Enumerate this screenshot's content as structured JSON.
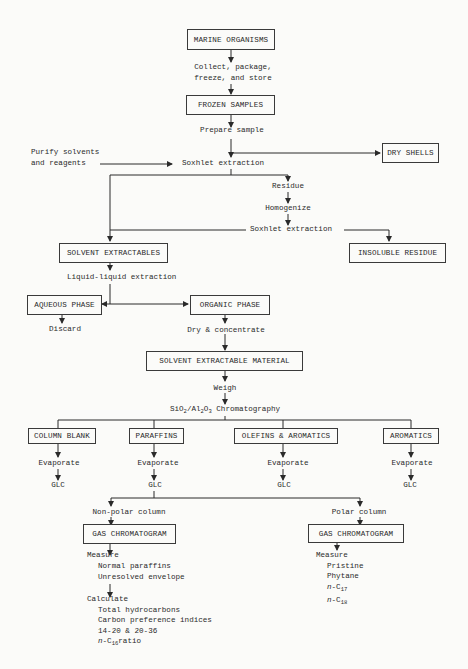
{
  "boxes": {
    "marine_organisms": "MARINE ORGANISMS",
    "frozen_samples": "FROZEN SAMPLES",
    "dry_shells": "DRY SHELLS",
    "solvent_extractables": "SOLVENT EXTRACTABLES",
    "insoluble_residue": "INSOLUBLE RESIDUE",
    "aqueous_phase": "AQUEOUS PHASE",
    "organic_phase": "ORGANIC PHASE",
    "solvent_extractable_material": "SOLVENT EXTRACTABLE MATERIAL",
    "column_blank": "COLUMN BLANK",
    "paraffins": "PARAFFINS",
    "olefins_aromatics": "OLEFINS & AROMATICS",
    "aromatics": "AROMATICS",
    "gas_chromatogram_nonpolar": "GAS CHROMATOGRAM",
    "gas_chromatogram_polar": "GAS CHROMATOGRAM"
  },
  "steps": {
    "collect_1": "Collect, package,",
    "collect_2": "freeze, and store",
    "prepare_sample": "Prepare sample",
    "purify_1": "Purify solvents",
    "purify_2": "and reagents",
    "soxhlet_1": "Soxhlet extraction",
    "residue": "Residue",
    "homogenize": "Homogenize",
    "soxhlet_2": "Soxhlet extraction",
    "liquid_liquid": "Liquid-liquid extraction",
    "discard": "Discard",
    "dry_concentrate": "Dry & concentrate",
    "weigh": "Weigh",
    "chromatography": "SiO2/Al2O3 Chromatography",
    "evaporate": "Evaporate",
    "glc": "GLC",
    "non_polar_column": "Non-polar column",
    "polar_column": "Polar column"
  },
  "nonpolar_results": {
    "measure": "Measure",
    "measure_items": [
      "Normal paraffins",
      "Unresolved envelope"
    ],
    "calculate": "Calculate",
    "calculate_items": [
      "Total hydrocarbons",
      "Carbon preference indices",
      "14-20 & 20-36",
      "n-C16 ratio"
    ]
  },
  "polar_results": {
    "measure": "Measure",
    "measure_items": [
      "Pristine",
      "Phytane",
      "n-C17",
      "n-C18"
    ]
  }
}
